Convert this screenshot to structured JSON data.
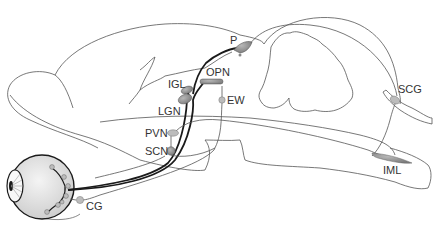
{
  "diagram": {
    "type": "anatomical-pathway",
    "colors": {
      "outline": "#555555",
      "pathway_dark": "#1a1a1a",
      "nucleus_fill": "#8c8c8c",
      "nucleus_light": "#b5b5b5",
      "eye_fill": "#e6e6e6",
      "label": "#333333"
    },
    "labels": {
      "p": "P",
      "opn": "OPN",
      "igl": "IGL",
      "lgn": "LGN",
      "ew": "EW",
      "pvn": "PVN",
      "scn": "SCN",
      "cg": "CG",
      "scg": "SCG",
      "iml": "IML"
    },
    "nodes": [
      {
        "id": "P",
        "name": "P",
        "x": 240,
        "y": 47
      },
      {
        "id": "OPN",
        "name": "OPN",
        "x": 208,
        "y": 82
      },
      {
        "id": "IGL",
        "name": "IGL",
        "x": 186,
        "y": 91
      },
      {
        "id": "LGN",
        "name": "LGN",
        "x": 183,
        "y": 100
      },
      {
        "id": "EW",
        "name": "EW",
        "x": 221,
        "y": 99
      },
      {
        "id": "PVN",
        "name": "PVN",
        "x": 172,
        "y": 133
      },
      {
        "id": "SCN",
        "name": "SCN",
        "x": 171,
        "y": 151
      },
      {
        "id": "CG",
        "name": "CG",
        "x": 79,
        "y": 200
      },
      {
        "id": "SCG",
        "name": "SCG",
        "x": 394,
        "y": 100
      },
      {
        "id": "IML",
        "name": "IML",
        "x": 385,
        "y": 160
      },
      {
        "id": "EYE",
        "name": "eye",
        "x": 40,
        "y": 185
      }
    ],
    "edges": [
      {
        "from": "EYE",
        "to": "SCN",
        "style": "thick"
      },
      {
        "from": "EYE",
        "to": "IGL",
        "style": "thick"
      },
      {
        "from": "EYE",
        "to": "LGN",
        "style": "thick"
      },
      {
        "from": "EYE",
        "to": "OPN",
        "style": "thick"
      },
      {
        "from": "EYE",
        "to": "P",
        "style": "thick"
      },
      {
        "from": "SCN",
        "to": "PVN",
        "style": "thin"
      },
      {
        "from": "PVN",
        "to": "IML",
        "style": "thin"
      },
      {
        "from": "IML",
        "to": "SCG",
        "style": "thin"
      },
      {
        "from": "SCG",
        "to": "P",
        "style": "thin"
      },
      {
        "from": "OPN",
        "to": "EW",
        "style": "thin"
      },
      {
        "from": "EW",
        "to": "CG",
        "style": "thin"
      },
      {
        "from": "CG",
        "to": "EYE",
        "style": "thin"
      }
    ]
  }
}
